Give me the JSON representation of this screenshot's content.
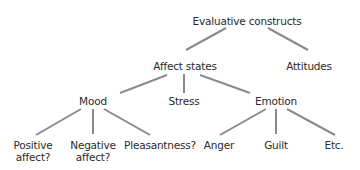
{
  "diagram": {
    "type": "tree",
    "line_color": "#8a8a8a",
    "text_color": "#2a2a2a",
    "root": {
      "label": "Evaluative constructs",
      "children": [
        {
          "label": "Affect states",
          "children": [
            {
              "label": "Mood",
              "children": [
                {
                  "label_line1": "Positive",
                  "label_line2": "affect?"
                },
                {
                  "label_line1": "Negative",
                  "label_line2": "affect?"
                },
                {
                  "label": "Pleasantness?"
                }
              ]
            },
            {
              "label": "Stress"
            },
            {
              "label": "Emotion",
              "children": [
                {
                  "label": "Anger"
                },
                {
                  "label": "Guilt"
                },
                {
                  "label": "Etc."
                }
              ]
            }
          ]
        },
        {
          "label": "Attitudes"
        }
      ]
    }
  }
}
